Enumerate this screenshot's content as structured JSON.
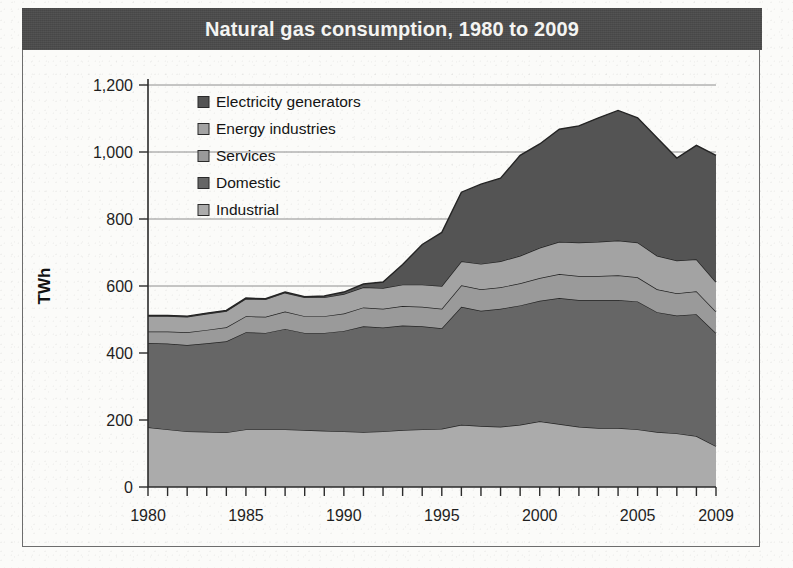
{
  "title": "Natural gas consumption, 1980 to 2009",
  "axis": {
    "ylabel": "TWh",
    "y_ticks": [
      "0",
      "200",
      "400",
      "600",
      "800",
      "1,000",
      "1,200"
    ],
    "x_ticks": [
      "1980",
      "1985",
      "1990",
      "1995",
      "2000",
      "2005",
      "2009"
    ]
  },
  "legend": {
    "items": [
      {
        "label": "Electricity generators",
        "color": "#545454"
      },
      {
        "label": "Energy industries",
        "color": "#a3a3a3"
      },
      {
        "label": "Services",
        "color": "#9a9a9a"
      },
      {
        "label": "Domestic",
        "color": "#666666"
      },
      {
        "label": "Industrial",
        "color": "#ababab"
      }
    ]
  },
  "colors": {
    "title_bar": "#4b4b4b",
    "title_text": "#f4f4f2",
    "paper": "#fbfbf9",
    "frame": "#6d6d6d",
    "axis": "#2b2b2b",
    "gridline": "#8e8e8e",
    "band_edge": "#242424"
  },
  "chart_data": {
    "type": "area",
    "stacked": true,
    "title": "Natural gas consumption, 1980 to 2009",
    "xlabel": "",
    "ylabel": "TWh",
    "ylim": [
      0,
      1200
    ],
    "xlim": [
      1980,
      2009
    ],
    "grid": true,
    "legend_position": "top-left inside plot",
    "x": [
      1980,
      1981,
      1982,
      1983,
      1984,
      1985,
      1986,
      1987,
      1988,
      1989,
      1990,
      1991,
      1992,
      1993,
      1994,
      1995,
      1996,
      1997,
      1998,
      1999,
      2000,
      2001,
      2002,
      2003,
      2004,
      2005,
      2006,
      2007,
      2008,
      2009
    ],
    "series": [
      {
        "name": "Industrial",
        "color": "#ababab",
        "values": [
          178,
          172,
          166,
          165,
          163,
          172,
          172,
          172,
          170,
          168,
          166,
          164,
          166,
          170,
          172,
          174,
          186,
          182,
          180,
          186,
          196,
          188,
          180,
          176,
          176,
          172,
          164,
          160,
          152,
          122
        ]
      },
      {
        "name": "Domestic",
        "color": "#666666",
        "values": [
          252,
          256,
          258,
          264,
          272,
          290,
          288,
          300,
          290,
          292,
          300,
          316,
          310,
          312,
          308,
          300,
          352,
          344,
          352,
          356,
          360,
          376,
          378,
          382,
          382,
          382,
          358,
          352,
          364,
          338
        ]
      },
      {
        "name": "Services",
        "color": "#9a9a9a",
        "values": [
          34,
          36,
          38,
          40,
          42,
          48,
          48,
          52,
          50,
          50,
          52,
          56,
          56,
          58,
          58,
          58,
          64,
          64,
          64,
          66,
          68,
          72,
          72,
          72,
          74,
          72,
          68,
          66,
          68,
          64
        ]
      },
      {
        "name": "Energy industries",
        "color": "#a3a3a3",
        "values": [
          46,
          46,
          46,
          48,
          48,
          52,
          52,
          56,
          56,
          56,
          58,
          60,
          62,
          64,
          66,
          68,
          72,
          76,
          78,
          82,
          90,
          96,
          100,
          102,
          104,
          104,
          100,
          98,
          96,
          88
        ]
      },
      {
        "name": "Electricity generators",
        "color": "#545454",
        "values": [
          2,
          2,
          2,
          2,
          2,
          2,
          2,
          2,
          2,
          4,
          6,
          10,
          18,
          60,
          120,
          160,
          206,
          238,
          248,
          300,
          310,
          336,
          348,
          370,
          388,
          372,
          352,
          306,
          340,
          378
        ]
      }
    ]
  }
}
